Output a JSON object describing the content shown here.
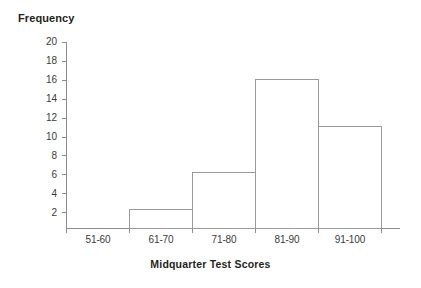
{
  "chart_data": {
    "type": "bar",
    "title": "",
    "xlabel": "Midquarter Test Scores",
    "ylabel": "Frequency",
    "categories": [
      "51-60",
      "61-70",
      "71-80",
      "81-90",
      "91-100"
    ],
    "values": [
      0,
      2,
      6,
      16,
      11
    ],
    "ylim": [
      0,
      20
    ],
    "y_ticks": [
      2,
      4,
      6,
      8,
      10,
      12,
      14,
      16,
      18,
      20
    ],
    "grid": false,
    "legend": null,
    "bar_fill_color": "#ffffff",
    "bar_outline_color": "#9a9a9a",
    "axis_color": "#8c8c8c",
    "text_color": "#231f20"
  },
  "axis": {
    "y_title": "Frequency",
    "x_title": "Midquarter Test Scores"
  },
  "y_tick_labels": [
    "20",
    "18",
    "16",
    "14",
    "12",
    "10",
    "8",
    "6",
    "4",
    "2"
  ],
  "x_tick_labels": [
    "51-60",
    "61-70",
    "71-80",
    "81-90",
    "91-100"
  ]
}
